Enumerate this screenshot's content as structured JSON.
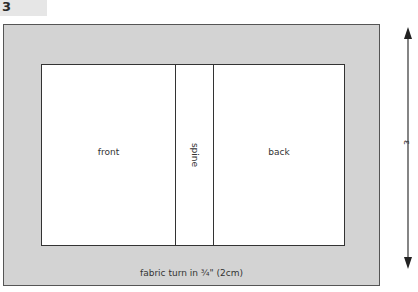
{
  "step": {
    "number": "3"
  },
  "diagram": {
    "panels": {
      "front": "front",
      "spine": "spine",
      "back": "back"
    },
    "turn_allowance_label": "fabric turn in ¾\" (2cm)",
    "height_dimension_label": "ε"
  },
  "colors": {
    "fabric_border": "#d3d3d3",
    "board_fill": "#ffffff",
    "outline": "#333333",
    "badge": "#e6e6e6"
  }
}
